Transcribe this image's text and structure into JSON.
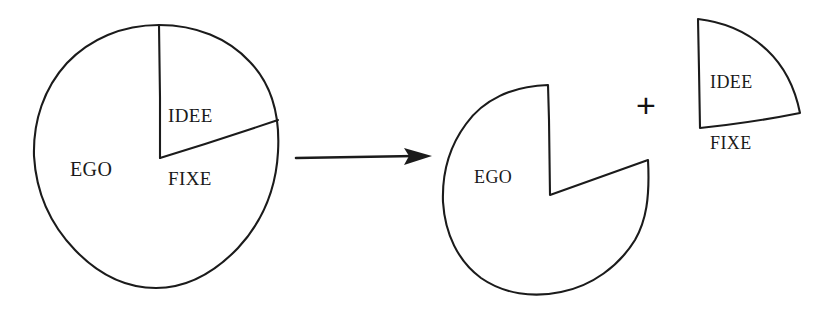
{
  "figure": {
    "kind": "hand-drawn-pie-diagram",
    "background_color": "#ffffff",
    "ink_color": "#1b1b1b",
    "operator": "+",
    "arrow": {
      "name": "transformation-arrow",
      "direction": "right",
      "x_start": 295,
      "x_end": 432,
      "y": 157
    },
    "left_pie": {
      "name": "whole-pie",
      "center_x": 156,
      "center_y": 156,
      "radius": 122,
      "slices": [
        {
          "label": "EGO",
          "start_angle_deg": 72,
          "end_angle_deg": 360,
          "label_x": 70,
          "label_y": 158
        },
        {
          "label": "IDEE\nFIXE",
          "start_angle_deg": 0,
          "end_angle_deg": 72,
          "label_x": 168,
          "label_y": 62
        }
      ]
    },
    "right_pie": {
      "name": "pie-with-slice-removed",
      "center_x": 550,
      "center_y": 195,
      "radius": 110,
      "notch_start_angle_deg": 0,
      "notch_end_angle_deg": 65,
      "label": "EGO",
      "label_x": 474,
      "label_y": 167
    },
    "detached_slice": {
      "name": "removed-slice",
      "apex_x": 700,
      "apex_y": 128,
      "radius": 112,
      "start_angle_deg": 0,
      "end_angle_deg": 62,
      "label": "IDEE\nFIXE",
      "label_x": 710,
      "label_y": 32
    },
    "plus": {
      "symbol": "+",
      "x": 647,
      "y": 105
    }
  },
  "labels": {
    "ego_left": "EGO",
    "idee_fixe_left_line1": "IDEE",
    "idee_fixe_left_line2": "FIXE",
    "ego_right": "EGO",
    "idee_fixe_right_line1": "IDEE",
    "idee_fixe_right_line2": "FIXE",
    "plus": "+"
  }
}
